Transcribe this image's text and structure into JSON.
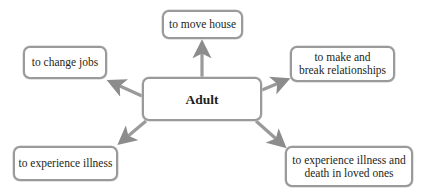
{
  "diagram": {
    "center": {
      "label": "Adult"
    },
    "nodes": [
      {
        "id": "move-house",
        "label": "to move house"
      },
      {
        "id": "change-jobs",
        "label": "to change jobs"
      },
      {
        "id": "relationships",
        "label": "to make and\nbreak relationships"
      },
      {
        "id": "illness",
        "label": "to experience illness"
      },
      {
        "id": "illness-death",
        "label": "to experience illness and\ndeath in loved ones"
      }
    ],
    "colors": {
      "arrow": "#8c8c8c",
      "border": "#9a9a9a",
      "text": "#231f20"
    }
  }
}
